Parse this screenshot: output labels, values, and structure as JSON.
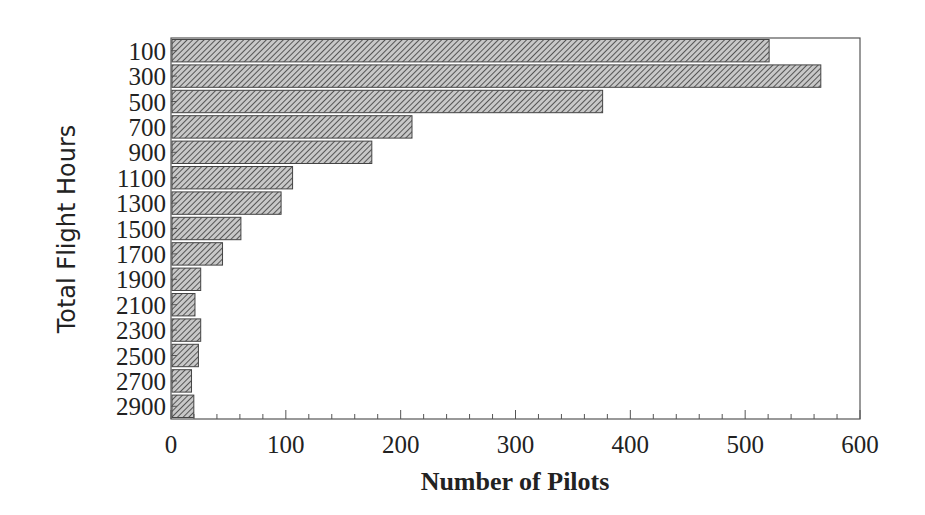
{
  "chart_data": {
    "type": "bar",
    "orientation": "horizontal",
    "title": "",
    "xlabel": "Number of Pilots",
    "ylabel": "Total Flight Hours",
    "categories": [
      "100",
      "300",
      "500",
      "700",
      "900",
      "1100",
      "1300",
      "1500",
      "1700",
      "1900",
      "2100",
      "2300",
      "2500",
      "2700",
      "2900"
    ],
    "values": [
      520,
      565,
      375,
      209,
      174,
      105,
      95,
      60,
      44,
      25,
      20,
      25,
      23,
      17,
      19
    ],
    "xlim": [
      0,
      600
    ],
    "xticks": [
      "0",
      "100",
      "200",
      "300",
      "400",
      "500",
      "600"
    ],
    "minor_ticks_per_major": 5,
    "grid": false,
    "legend": null,
    "bar_fill": "hatched",
    "colors": {
      "bar_fill": "#9a9a9a",
      "bar_stroke": "#444444",
      "axis": "#555555",
      "text": "#222222"
    }
  }
}
